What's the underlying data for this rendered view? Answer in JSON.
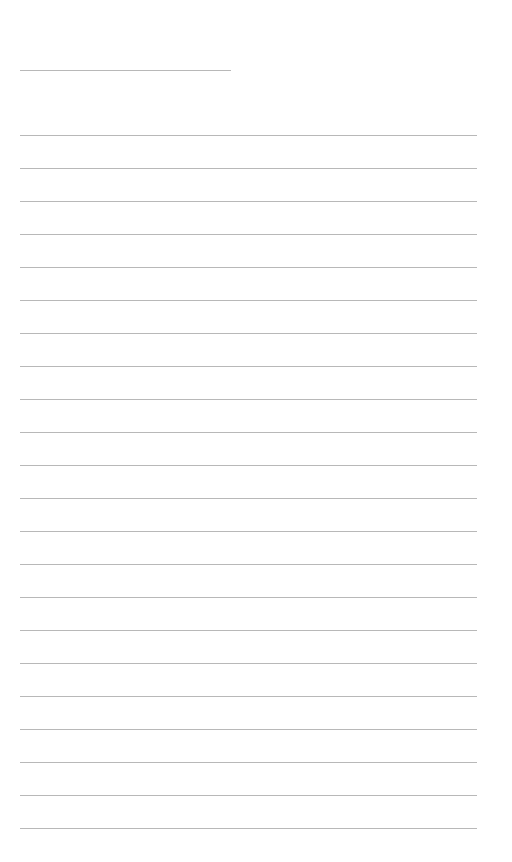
{
  "page": {
    "type": "lined-notepaper",
    "background_color": "#ffffff",
    "line_color": "#b8b8b8",
    "title_line": {
      "top": 70,
      "left": 20,
      "width": 211
    },
    "rules": {
      "count": 22,
      "first_top": 135,
      "spacing": 33,
      "left": 20,
      "width": 457
    }
  }
}
